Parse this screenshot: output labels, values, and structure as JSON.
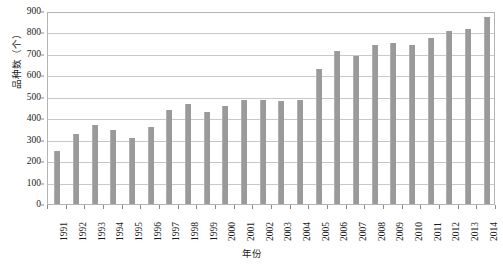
{
  "chart_data": {
    "type": "bar",
    "title": "",
    "subtitle": "",
    "xlabel": "年份",
    "ylabel": "品种数（个）",
    "categories": [
      "1991",
      "1992",
      "1993",
      "1994",
      "1995",
      "1996",
      "1997",
      "1998",
      "1999",
      "2000",
      "2001",
      "2002",
      "2003",
      "2004",
      "2005",
      "2006",
      "2007",
      "2008",
      "2009",
      "2010",
      "2011",
      "2012",
      "2013",
      "2014"
    ],
    "values": [
      248,
      325,
      368,
      347,
      308,
      360,
      437,
      465,
      430,
      455,
      485,
      483,
      480,
      483,
      630,
      715,
      692,
      740,
      752,
      740,
      775,
      805,
      815,
      870
    ],
    "ylim": [
      0,
      900
    ],
    "ytick_step": 100,
    "yticks": [
      "0",
      "100",
      "200",
      "300",
      "400",
      "500",
      "600",
      "700",
      "800",
      "900"
    ],
    "grid": true,
    "grid_axis": "y",
    "legend": "none",
    "bar_color": "#9a9a9a",
    "grid_color": "#c8c8c8",
    "axis_color": "#b4b4b4",
    "text_color": "#1a1a1a"
  }
}
